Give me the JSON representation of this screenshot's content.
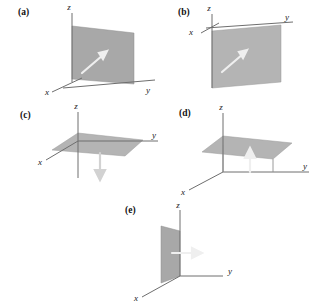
{
  "figure": {
    "background_color": "#ffffff",
    "plane_color": "#a8a8a8",
    "axis_color": "#6e6e6e",
    "arrow_color": "#efefef"
  },
  "panels": [
    {
      "id": "a",
      "label": "(a)",
      "axes": {
        "x": "x",
        "y": "y",
        "z": "z"
      },
      "plane": "vertical plane parallel to x-z, standing on the y axis",
      "arrow": {
        "direction": "up-right, out of plane",
        "color": "#efefef"
      }
    },
    {
      "id": "b",
      "label": "(b)",
      "axes": {
        "x": "x",
        "y": "y",
        "z": "z"
      },
      "plane": "vertical plane hanging below the y axis",
      "arrow": {
        "direction": "up-right, out of plane",
        "color": "#efefef"
      }
    },
    {
      "id": "c",
      "label": "(c)",
      "axes": {
        "x": "x",
        "y": "y",
        "z": "z"
      },
      "plane": "horizontal plane in the x-y plane through the origin",
      "arrow": {
        "direction": "down, along minus z",
        "color": "#d2d2d2"
      }
    },
    {
      "id": "d",
      "label": "(d)",
      "axes": {
        "x": "x",
        "y": "y",
        "z": "z"
      },
      "plane": "horizontal plane raised above the x-y plane on struts",
      "arrow": {
        "direction": "up, along plus z",
        "color": "#efefef"
      }
    },
    {
      "id": "e",
      "label": "(e)",
      "axes": {
        "x": "x",
        "y": "y",
        "z": "z"
      },
      "plane": "vertical plane in the x-z plane",
      "arrow": {
        "direction": "right, along plus y",
        "color": "#efefef"
      }
    }
  ]
}
